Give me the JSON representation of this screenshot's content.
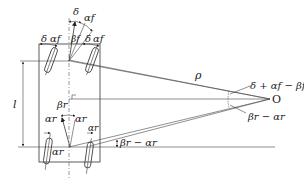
{
  "diagram": {
    "type": "vehicle-kinematics",
    "labels": {
      "delta_top": "δ",
      "alpha_f_top": "αf",
      "delta_left": "δ",
      "alpha_f_left": "αf",
      "beta_f": "βf",
      "delta_right": "δ",
      "alpha_f_right": "αf",
      "l": "l",
      "beta_r": "βr",
      "alpha_r_left": "αr",
      "alpha_r_right": "αr",
      "alpha_r_center": "αr",
      "alpha_r_bottom": "αr",
      "rho": "ρ",
      "front_angle": "δ + αf − βf",
      "rear_angle": "βr − αr",
      "rear_angle_left": "βr − αr",
      "center": "O"
    }
  }
}
